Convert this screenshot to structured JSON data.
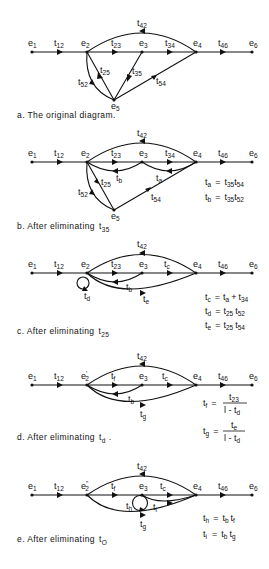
{
  "figure": {
    "panels": [
      {
        "id": "a",
        "caption": "a. The original diagram.",
        "nodes": [
          "e1",
          "e2",
          "e3",
          "e4",
          "e5",
          "e6"
        ],
        "branches": [
          "t12",
          "t23",
          "t34",
          "t46",
          "t42",
          "t25",
          "t52",
          "t35",
          "t54"
        ],
        "equations": []
      },
      {
        "id": "b",
        "caption_prefix": "b. After eliminating ",
        "caption_var": "t",
        "caption_sub": "35",
        "nodes": [
          "e1",
          "e2",
          "e3",
          "e4",
          "e5",
          "e6"
        ],
        "branches": [
          "t12",
          "t23",
          "t34",
          "t46",
          "t42",
          "tb",
          "ta",
          "t25",
          "t52",
          "t54"
        ],
        "equations": [
          {
            "lhs": "ta",
            "rhs": "t35 t54"
          },
          {
            "lhs": "tb",
            "rhs": "t35 t52"
          }
        ]
      },
      {
        "id": "c",
        "caption_prefix": "c. After eliminating ",
        "caption_var": "t",
        "caption_sub": "25",
        "nodes": [
          "e1",
          "e2",
          "e3",
          "e4",
          "e6"
        ],
        "branches": [
          "t12",
          "t23",
          "tc",
          "t46",
          "t42",
          "tb",
          "td",
          "te"
        ],
        "equations": [
          {
            "lhs": "tc",
            "rhs": "ta + t34"
          },
          {
            "lhs": "td",
            "rhs": "t25 t52"
          },
          {
            "lhs": "te",
            "rhs": "t25 t54"
          }
        ]
      },
      {
        "id": "d",
        "caption_prefix": "d. After eliminating ",
        "caption_var": "t",
        "caption_sub": "d",
        "caption_suffix": " .",
        "nodes": [
          "e1",
          "e2'",
          "e3",
          "e4",
          "e6"
        ],
        "branches": [
          "t12",
          "tf",
          "tc",
          "t46",
          "t42",
          "tb",
          "tg"
        ],
        "equations": [
          {
            "lhs": "tf",
            "rhs": "t23 / (1 - td)"
          },
          {
            "lhs": "tg",
            "rhs": "te / (1 - td)"
          }
        ]
      },
      {
        "id": "e",
        "caption_prefix": "e. After eliminating ",
        "caption_var": "t",
        "caption_sub": "O",
        "nodes": [
          "e1",
          "e2''",
          "e3",
          "e4",
          "e6"
        ],
        "branches": [
          "t12",
          "tf",
          "tc",
          "t46",
          "t42",
          "th",
          "ti",
          "tg"
        ],
        "equations": [
          {
            "lhs": "th",
            "rhs": "tb tf"
          },
          {
            "lhs": "ti",
            "rhs": "tb tg"
          }
        ]
      }
    ],
    "labels": {
      "cap_a": "a. The original diagram.",
      "cap_b": "b. After eliminating",
      "cap_c": "c. After eliminating",
      "cap_d": "d. After eliminating",
      "cap_e": "e. After eliminating",
      "t": "t",
      "e": "e",
      "s1": "1",
      "s2": "2",
      "s3": "3",
      "s4": "4",
      "s5": "5",
      "s6": "6",
      "s12": "12",
      "s23": "23",
      "s34": "34",
      "s46": "46",
      "s42": "42",
      "s25": "25",
      "s52": "52",
      "s35": "35",
      "s54": "54",
      "sa": "a",
      "sb": "b",
      "sc": "c",
      "sd": "d",
      "se": "e",
      "sf": "f",
      "sg": "g",
      "sh": "h",
      "si": "i",
      "sO": "O",
      "eq": "=",
      "plus": "+",
      "one_minus": "l - ",
      "dot": ".",
      "prime": "'",
      "dprime": "\""
    }
  }
}
